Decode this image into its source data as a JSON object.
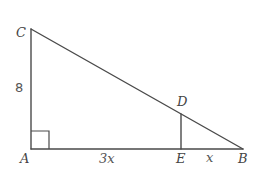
{
  "figure": {
    "type": "right-triangle",
    "colors": {
      "background": "#ffffff",
      "stroke": "#4a4a4a",
      "label": "#444444"
    },
    "points": {
      "A": {
        "label": "A",
        "x": 31,
        "y": 149
      },
      "B": {
        "label": "B",
        "x": 243,
        "y": 149
      },
      "C": {
        "label": "C",
        "x": 31,
        "y": 29
      },
      "D": {
        "label": "D",
        "x": 181,
        "y": 114
      },
      "E": {
        "label": "E",
        "x": 181,
        "y": 149
      }
    },
    "segments": [
      {
        "name": "AC",
        "from": "A",
        "to": "C"
      },
      {
        "name": "AB",
        "from": "A",
        "to": "B"
      },
      {
        "name": "CB",
        "from": "C",
        "to": "B"
      },
      {
        "name": "DE",
        "from": "D",
        "to": "E"
      }
    ],
    "right_angle": {
      "vertex": "A",
      "size": 18
    },
    "measurements": {
      "AC": "8",
      "AE": "3x",
      "EB": "x"
    }
  }
}
